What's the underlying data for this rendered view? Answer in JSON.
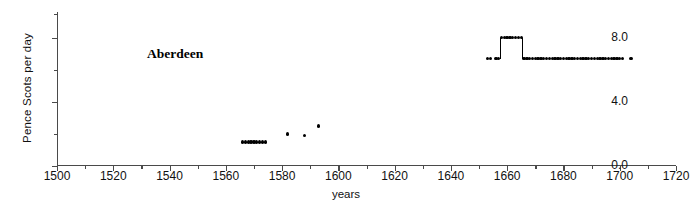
{
  "chart_data": {
    "type": "scatter",
    "title": "Aberdeen",
    "xlabel": "years",
    "ylabel": "Pence Scots per day",
    "xlim": [
      1500,
      1720
    ],
    "ylim": [
      0.0,
      9.6
    ],
    "grid": false,
    "legend": null,
    "xticks": [
      1500,
      1520,
      1540,
      1560,
      1580,
      1600,
      1620,
      1640,
      1660,
      1680,
      1700,
      1720
    ],
    "xticklabels": [
      "1500",
      "1520",
      "1540",
      "1560",
      "1580",
      "1600",
      "1620",
      "1640",
      "1660",
      "1680",
      "1700",
      "1720"
    ],
    "xminorticks": [
      1510,
      1530,
      1550,
      1570,
      1590,
      1610,
      1630,
      1650,
      1670,
      1690,
      1710
    ],
    "yticks": [
      0.0,
      4.0,
      8.0
    ],
    "yticklabels": [
      "0.0",
      "4.0",
      "8.0"
    ],
    "yminorticks": [
      2.0,
      6.0,
      9.5
    ],
    "marker": "filled-circle",
    "marker_color": "#000000",
    "series": [
      {
        "name": "Aberdeen wage",
        "x": [
          1566,
          1567,
          1568,
          1569,
          1570,
          1571,
          1572,
          1573,
          1574,
          1582,
          1588,
          1593,
          1653,
          1654,
          1656,
          1657,
          1658,
          1659,
          1660,
          1661,
          1662,
          1663,
          1664,
          1665,
          1666,
          1667,
          1668,
          1669,
          1670,
          1671,
          1672,
          1673,
          1674,
          1675,
          1676,
          1677,
          1678,
          1679,
          1680,
          1681,
          1682,
          1683,
          1684,
          1685,
          1686,
          1687,
          1688,
          1689,
          1690,
          1691,
          1692,
          1693,
          1694,
          1695,
          1696,
          1697,
          1698,
          1699,
          1700,
          1701,
          1704
        ],
        "y": [
          1.5,
          1.5,
          1.5,
          1.5,
          1.5,
          1.5,
          1.5,
          1.5,
          1.5,
          2.0,
          1.9,
          2.5,
          6.7,
          6.7,
          6.7,
          6.7,
          8.0,
          8.0,
          8.0,
          8.0,
          8.0,
          8.0,
          8.0,
          8.0,
          6.7,
          6.7,
          6.7,
          6.7,
          6.7,
          6.7,
          6.7,
          6.7,
          6.7,
          6.7,
          6.7,
          6.7,
          6.7,
          6.7,
          6.7,
          6.7,
          6.7,
          6.7,
          6.7,
          6.7,
          6.7,
          6.7,
          6.7,
          6.7,
          6.7,
          6.7,
          6.7,
          6.7,
          6.7,
          6.7,
          6.7,
          6.7,
          6.7,
          6.7,
          6.7,
          6.7,
          6.7
        ]
      }
    ]
  }
}
